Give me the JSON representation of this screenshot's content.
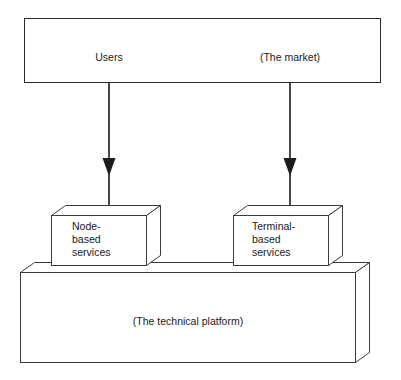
{
  "diagram": {
    "stroke_color": "#2b2b2b",
    "fill_color": "#ffffff",
    "text_color": "#1a1a1a",
    "top_band": {
      "name": "users-market-band",
      "labels": {
        "left": "Users",
        "right": "(The market)"
      }
    },
    "arrows": [
      {
        "name": "arrow-users-to-node",
        "from": "Users",
        "to": "Node-based services"
      },
      {
        "name": "arrow-market-to-terminal",
        "from": "(The market)",
        "to": "Terminal-based services"
      }
    ],
    "service_boxes": [
      {
        "name": "node-based-services-box",
        "lines": [
          "Node-",
          "based",
          "services"
        ]
      },
      {
        "name": "terminal-based-services-box",
        "lines": [
          "Terminal-",
          "based",
          "services"
        ]
      }
    ],
    "platform": {
      "name": "technical-platform-slab",
      "label": "(The technical platform)"
    }
  }
}
